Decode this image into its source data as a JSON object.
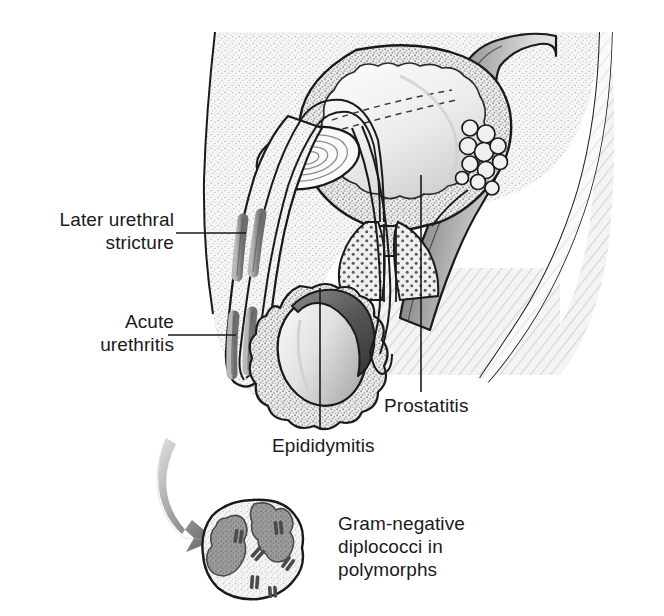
{
  "figure": {
    "width": 664,
    "height": 616,
    "background_color": "#ffffff",
    "line_color": "#1a1a1a",
    "body_fill": "#f2f2f2",
    "tissue_stipple_color": "#9a9a9a",
    "lesion_color": "#8c8c8c",
    "arrow_color_light": "#d8d8d8",
    "arrow_color_dark": "#6e6e6e"
  },
  "labels": {
    "later_urethral_stricture": "Later urethral\nstricture",
    "acute_urethritis": "Acute\nurethritis",
    "epididymitis": "Epididymitis",
    "prostatitis": "Prostatitis",
    "gram_negative_caption": "Gram-negative\ndiplococci in\npolymorphs"
  },
  "anatomy": {
    "structures": [
      {
        "name": "bladder",
        "description": "Urinary bladder with thick stippled muscular wall and trigone dashed lines"
      },
      {
        "name": "prostate",
        "description": "Prostate gland shown with dark dotted stipple below bladder neck"
      },
      {
        "name": "seminal-vesicle",
        "description": "Grape-like lobulated cluster posterior to bladder"
      },
      {
        "name": "rectum",
        "description": "Rectum shown as shaded tube posterior to prostate"
      },
      {
        "name": "pubic-symphysis",
        "description": "Concentric ring structure anterior to bladder"
      },
      {
        "name": "penis",
        "description": "Penile shaft containing urethra descending anteriorly"
      },
      {
        "name": "urethra",
        "description": "Urethral channel running length of penis to bladder"
      },
      {
        "name": "scrotum",
        "description": "Scrotal sac with stippled border"
      },
      {
        "name": "testis",
        "description": "Ovoid testis with gradient shading"
      },
      {
        "name": "epididymis",
        "description": "Dark curved cap over superior-posterior testis"
      },
      {
        "name": "vas-deferens",
        "description": "Duct looping from epididymis up toward seminal vesicle"
      },
      {
        "name": "sacrum",
        "description": "Hatched bony region posteriorly"
      }
    ],
    "lesion_sites": [
      {
        "name": "stricture-band-upper",
        "label_ref": "later_urethral_stricture"
      },
      {
        "name": "urethritis-band-lower",
        "label_ref": "acute_urethritis"
      }
    ]
  },
  "inset": {
    "name": "polymorph-cell",
    "description": "Neutrophil polymorph with multilobed nucleus containing intracellular gram-negative diplococci",
    "diplococci_pairs": 6,
    "caption_ref": "gram_negative_caption"
  }
}
